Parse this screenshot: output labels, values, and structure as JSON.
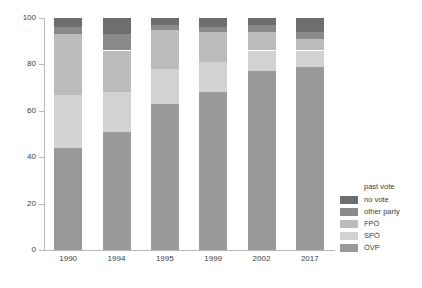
{
  "chart_data": {
    "type": "bar",
    "stacked": true,
    "title": "",
    "xlabel": "",
    "ylabel": "",
    "ylim": [
      0,
      100
    ],
    "yticks": [
      0,
      20,
      40,
      60,
      80,
      100
    ],
    "grid": false,
    "legend_position": "right",
    "legend_title": "past vote",
    "categories": [
      "1990",
      "1994",
      "1995",
      "1999",
      "2002",
      "2017"
    ],
    "series": [
      {
        "name": "ÖVP",
        "color": "#9a9a9a",
        "values": [
          44,
          51,
          63,
          68,
          77,
          79
        ]
      },
      {
        "name": "SPÖ",
        "color": "#d2d2d2",
        "values": [
          23,
          17,
          15,
          13,
          9,
          7
        ]
      },
      {
        "name": "FPÖ",
        "color": "#bcbcbc",
        "values": [
          26,
          18,
          17,
          13,
          8,
          5
        ]
      },
      {
        "name": "other party",
        "color": "#8a8a8a",
        "values": [
          3,
          7,
          2,
          2,
          3,
          3
        ]
      },
      {
        "name": "no vote",
        "color": "#6e6e6e",
        "values": [
          4,
          7,
          3,
          4,
          3,
          6
        ]
      }
    ]
  },
  "axis": {
    "y_tick_labels": [
      "0",
      "20",
      "40",
      "60",
      "80",
      "100"
    ]
  }
}
